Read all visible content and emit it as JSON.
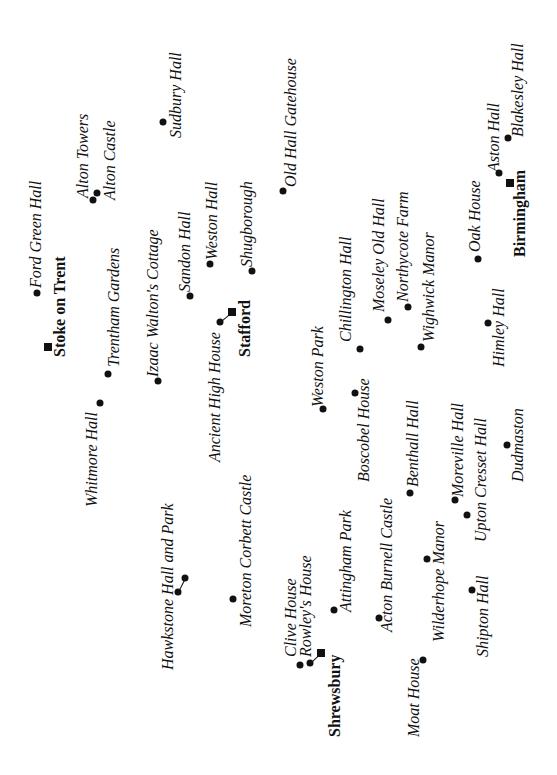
{
  "map": {
    "orientation": "rotated -90deg",
    "towns": [
      {
        "name": "Stoke on Trent",
        "marker": [
          48,
          347
        ],
        "label": [
          52,
          357
        ]
      },
      {
        "name": "Stafford",
        "marker": [
          232,
          312
        ],
        "label": [
          237,
          357
        ]
      },
      {
        "name": "Birmingham",
        "marker": [
          510,
          183
        ],
        "label": [
          512,
          257
        ]
      },
      {
        "name": "Shrewsbury",
        "marker": [
          321,
          653
        ],
        "label": [
          327,
          737
        ]
      }
    ],
    "sites": [
      {
        "name": "Ford Green Hall",
        "marker": [
          37,
          293
        ],
        "label": [
          28,
          288
        ]
      },
      {
        "name": "Alton Towers",
        "marker": [
          93,
          200
        ],
        "label": [
          75,
          198
        ]
      },
      {
        "name": "Alton Castle",
        "marker": [
          97,
          193
        ],
        "label": [
          102,
          200
        ]
      },
      {
        "name": "Sudbury Hall",
        "marker": [
          163,
          122
        ],
        "label": [
          168,
          138
        ]
      },
      {
        "name": "Trentham Gardens",
        "marker": [
          108,
          374
        ],
        "label": [
          106,
          367
        ]
      },
      {
        "name": "Whitmore Hall",
        "marker": [
          100,
          403
        ],
        "label": [
          84,
          507
        ]
      },
      {
        "name": "Izaac Walton's Cottage",
        "marker": [
          158,
          381
        ],
        "label": [
          145,
          377
        ]
      },
      {
        "name": "Sandon Hall",
        "marker": [
          190,
          296
        ],
        "label": [
          177,
          292
        ]
      },
      {
        "name": "Weston Hall",
        "marker": [
          210,
          264
        ],
        "label": [
          204,
          260
        ]
      },
      {
        "name": "Shugborough",
        "marker": [
          252,
          271
        ],
        "label": [
          239,
          267
        ]
      },
      {
        "name": "Ancient High House",
        "marker": [
          220,
          322
        ],
        "label": [
          207,
          462
        ]
      },
      {
        "name": "Old Hall Gatehouse",
        "marker": [
          283,
          191
        ],
        "label": [
          283,
          187
        ]
      },
      {
        "name": "Chillington Hall",
        "marker": [
          360,
          349
        ],
        "label": [
          338,
          342
        ]
      },
      {
        "name": "Moseley Old Hall",
        "marker": [
          388,
          320
        ],
        "label": [
          371,
          312
        ]
      },
      {
        "name": "Northycote Farm",
        "marker": [
          408,
          307
        ],
        "label": [
          395,
          302
        ]
      },
      {
        "name": "Wighwick Manor",
        "marker": [
          421,
          347
        ],
        "label": [
          421,
          342
        ]
      },
      {
        "name": "Oak House",
        "marker": [
          478,
          259
        ],
        "label": [
          467,
          252
        ]
      },
      {
        "name": "Aston Hall",
        "marker": [
          499,
          173
        ],
        "label": [
          486,
          172
        ]
      },
      {
        "name": "Blakesley Hall",
        "marker": [
          508,
          138
        ],
        "label": [
          510,
          137
        ]
      },
      {
        "name": "Himley Hall",
        "marker": [
          488,
          323
        ],
        "label": [
          491,
          367
        ]
      },
      {
        "name": "Weston Park",
        "marker": [
          323,
          409
        ],
        "label": [
          310,
          407
        ]
      },
      {
        "name": "Boscobel House",
        "marker": [
          355,
          393
        ],
        "label": [
          356,
          482
        ]
      },
      {
        "name": "Benthall Hall",
        "marker": [
          410,
          493
        ],
        "label": [
          405,
          487
        ]
      },
      {
        "name": "Moreville Hall",
        "marker": [
          455,
          500
        ],
        "label": [
          450,
          497
        ]
      },
      {
        "name": "Upton Cresset Hall",
        "marker": [
          467,
          515
        ],
        "label": [
          473,
          542
        ]
      },
      {
        "name": "Dudmaston",
        "marker": [
          507,
          445
        ],
        "label": [
          510,
          482
        ]
      },
      {
        "name": "Hawkstone Hall and Park",
        "marker": [
          178,
          592
        ],
        "marker2": [
          185,
          578
        ],
        "label": [
          160,
          670
        ]
      },
      {
        "name": "Moreton Corbett Castle",
        "marker": [
          233,
          599
        ],
        "label": [
          238,
          627
        ]
      },
      {
        "name": "Clive House",
        "marker": [
          300,
          665
        ],
        "label": [
          283,
          657
        ]
      },
      {
        "name": "Rowley's House",
        "marker": [
          310,
          663
        ],
        "label": [
          298,
          657
        ]
      },
      {
        "name": "Attingham Park",
        "marker": [
          334,
          610
        ],
        "label": [
          338,
          612
        ]
      },
      {
        "name": "Acton Burnell Castle",
        "marker": [
          379,
          618
        ],
        "label": [
          379,
          632
        ]
      },
      {
        "name": "Moat House",
        "marker": [
          423,
          660
        ],
        "label": [
          406,
          737
        ]
      },
      {
        "name": "Wilderhope Manor",
        "marker": [
          427,
          559
        ],
        "label": [
          431,
          642
        ]
      },
      {
        "name": "Shipton Hall",
        "marker": [
          472,
          590
        ],
        "label": [
          475,
          657
        ]
      }
    ],
    "connectors": [
      {
        "from": [
          220,
          322
        ],
        "to": [
          232,
          312
        ]
      },
      {
        "from": [
          178,
          592
        ],
        "to": [
          185,
          578
        ]
      },
      {
        "from": [
          310,
          663
        ],
        "to": [
          321,
          653
        ]
      }
    ]
  }
}
